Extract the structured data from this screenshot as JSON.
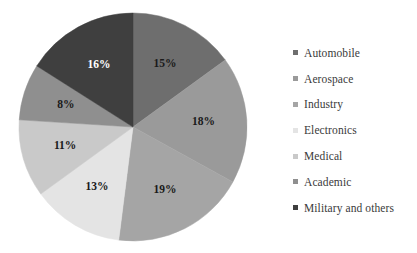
{
  "chart_data": {
    "type": "pie",
    "title": "",
    "subtitle": "",
    "xlabel": "",
    "ylabel": "",
    "grid": false,
    "legend_position": "right",
    "start_angle_deg": 0,
    "direction": "clockwise",
    "categories": [
      "Automobile",
      "Aerospace",
      "Industry",
      "Electronics",
      "Medical",
      "Academic",
      "Military and others"
    ],
    "values": [
      15,
      18,
      19,
      13,
      11,
      8,
      16
    ],
    "labels": [
      "15%",
      "18%",
      "19%",
      "13%",
      "11%",
      "8%",
      "16%"
    ],
    "colors": [
      "#6e6e6e",
      "#9a9a9a",
      "#a5a5a5",
      "#e4e4e4",
      "#c9c9c9",
      "#8f8f8f",
      "#3f3f3f"
    ],
    "label_text_colors": [
      "#1a1a1a",
      "#1a1a1a",
      "#1a1a1a",
      "#1a1a1a",
      "#1a1a1a",
      "#1a1a1a",
      "#ffffff"
    ],
    "slices": [
      {
        "name": "Automobile",
        "value": 15,
        "label": "15%",
        "color": "#6e6e6e"
      },
      {
        "name": "Aerospace",
        "value": 18,
        "label": "18%",
        "color": "#9a9a9a"
      },
      {
        "name": "Industry",
        "value": 19,
        "label": "19%",
        "color": "#a5a5a5"
      },
      {
        "name": "Electronics",
        "value": 13,
        "label": "13%",
        "color": "#e4e4e4"
      },
      {
        "name": "Medical",
        "value": 11,
        "label": "11%",
        "color": "#c9c9c9"
      },
      {
        "name": "Academic",
        "value": 8,
        "label": "8%",
        "color": "#8f8f8f"
      },
      {
        "name": "Military and others",
        "value": 16,
        "label": "16%",
        "color": "#3f3f3f"
      }
    ]
  },
  "legend": {
    "items": [
      {
        "label": "Automobile",
        "color": "#6e6e6e"
      },
      {
        "label": "Aerospace",
        "color": "#9a9a9a"
      },
      {
        "label": "Industry",
        "color": "#a5a5a5"
      },
      {
        "label": "Electronics",
        "color": "#e4e4e4"
      },
      {
        "label": "Medical",
        "color": "#c9c9c9"
      },
      {
        "label": "Academic",
        "color": "#8f8f8f"
      },
      {
        "label": "Military and others",
        "color": "#3f3f3f"
      }
    ]
  },
  "geometry": {
    "center_x": 133,
    "center_y": 127,
    "radius": 114
  }
}
